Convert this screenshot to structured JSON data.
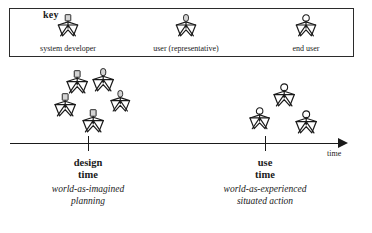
{
  "diagram": {
    "key": {
      "title": "key",
      "entries": [
        {
          "icon": "star-person-square-head-icon",
          "label": "system developer",
          "x": 68,
          "head": "square"
        },
        {
          "icon": "star-person-oval-head-icon",
          "label": "user (representative)",
          "x": 186,
          "head": "oval"
        },
        {
          "icon": "star-person-circle-head-icon",
          "label": "end user",
          "x": 306,
          "head": "circle"
        }
      ]
    },
    "axis": {
      "caption": "time",
      "ticks": [
        {
          "name": "design-time-tick",
          "x": 88
        },
        {
          "name": "use-time-tick",
          "x": 265
        }
      ]
    },
    "stages": [
      {
        "id": "design-time",
        "title_line1": "design",
        "title_line2": "time",
        "subtitle_line1": "world-as-imagined",
        "subtitle_line2": "planning",
        "x": 88
      },
      {
        "id": "use-time",
        "title_line1": "use",
        "title_line2": "time",
        "subtitle_line1": "world-as-experienced",
        "subtitle_line2": "situated action",
        "x": 265
      }
    ],
    "clusters": [
      {
        "id": "design-time-cluster",
        "figures": [
          {
            "head": "square",
            "x": 22,
            "y": 4,
            "scale": 1.0
          },
          {
            "head": "oval",
            "x": 48,
            "y": 2,
            "scale": 1.0
          },
          {
            "head": "square",
            "x": 10,
            "y": 27,
            "scale": 1.0
          },
          {
            "head": "oval",
            "x": 66,
            "y": 24,
            "scale": 0.92
          },
          {
            "head": "square",
            "x": 38,
            "y": 43,
            "scale": 1.0
          }
        ]
      },
      {
        "id": "use-time-cluster",
        "figures": [
          {
            "head": "circle",
            "x": 28,
            "y": 0,
            "scale": 1.0
          },
          {
            "head": "circle",
            "x": 4,
            "y": 24,
            "scale": 0.95
          },
          {
            "head": "circle",
            "x": 50,
            "y": 27,
            "scale": 1.0
          }
        ]
      }
    ],
    "colors": {
      "ink": "#1a1a1a",
      "head_fill": "#d4d4d4",
      "paper": "#ffffff"
    }
  }
}
